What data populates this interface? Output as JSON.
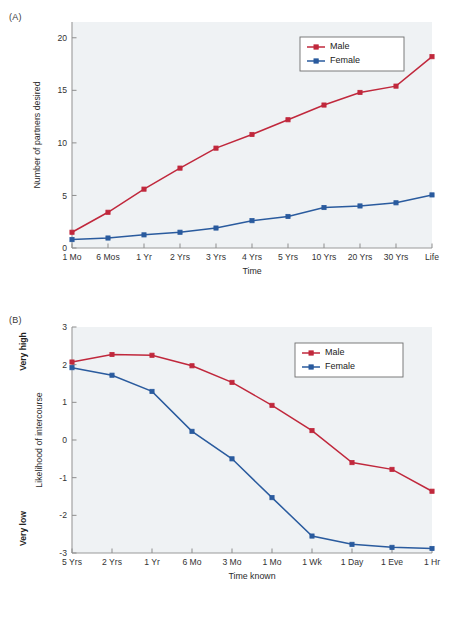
{
  "figure": {
    "panel_a_label": "(A)",
    "panel_b_label": "(B)",
    "colors": {
      "male": "#c0283c",
      "female": "#2a5b9e",
      "plot_background": "#eff2f4",
      "axis": "#9a9a9a",
      "page_background": "#ffffff"
    }
  },
  "chart_data": [
    {
      "panel": "(A)",
      "type": "line",
      "title": "",
      "xlabel": "Time",
      "ylabel": "Number of partners desired",
      "categories": [
        "1 Mo",
        "6 Mos",
        "1 Yr",
        "2 Yrs",
        "3 Yrs",
        "4 Yrs",
        "5 Yrs",
        "10 Yrs",
        "20 Yrs",
        "30 Yrs",
        "Life"
      ],
      "ylim": [
        0,
        21.5
      ],
      "yticks": [
        0,
        5,
        10,
        15,
        20
      ],
      "ytick_labels": [
        "0",
        "5",
        "10",
        "15",
        "20"
      ],
      "grid": false,
      "legend_position": "top-right",
      "series": [
        {
          "name": "Male",
          "color": "#c0283c",
          "marker": "square",
          "values": [
            1.5,
            3.4,
            5.6,
            7.6,
            9.5,
            10.8,
            12.2,
            13.6,
            14.8,
            15.4,
            18.2
          ]
        },
        {
          "name": "Female",
          "color": "#2a5b9e",
          "marker": "square",
          "values": [
            0.8,
            0.95,
            1.25,
            1.5,
            1.9,
            2.6,
            3.0,
            3.85,
            4.0,
            4.3,
            5.05
          ]
        }
      ]
    },
    {
      "panel": "(B)",
      "type": "line",
      "title": "",
      "xlabel": "Time known",
      "ylabel": "Likelihood of intercourse",
      "y_anchor_high": "Very high",
      "y_anchor_low": "Very low",
      "categories": [
        "5 Yrs",
        "2 Yrs",
        "1 Yr",
        "6 Mo",
        "3 Mo",
        "1 Mo",
        "1 Wk",
        "1 Day",
        "1 Eve",
        "1 Hr"
      ],
      "ylim": [
        -3,
        3
      ],
      "yticks": [
        3,
        2,
        1,
        0,
        -1,
        -2,
        -3
      ],
      "ytick_labels": [
        "3",
        "2",
        "1",
        "0",
        "-1",
        "-2",
        "-3"
      ],
      "grid": false,
      "legend_position": "top-right",
      "series": [
        {
          "name": "Male",
          "color": "#c0283c",
          "marker": "square",
          "values": [
            2.07,
            2.27,
            2.25,
            1.97,
            1.53,
            0.92,
            0.25,
            -0.6,
            -0.78,
            -1.36
          ]
        },
        {
          "name": "Female",
          "color": "#2a5b9e",
          "marker": "square",
          "values": [
            1.92,
            1.72,
            1.29,
            0.23,
            -0.5,
            -1.53,
            -2.55,
            -2.77,
            -2.85,
            -2.88
          ]
        }
      ]
    }
  ]
}
